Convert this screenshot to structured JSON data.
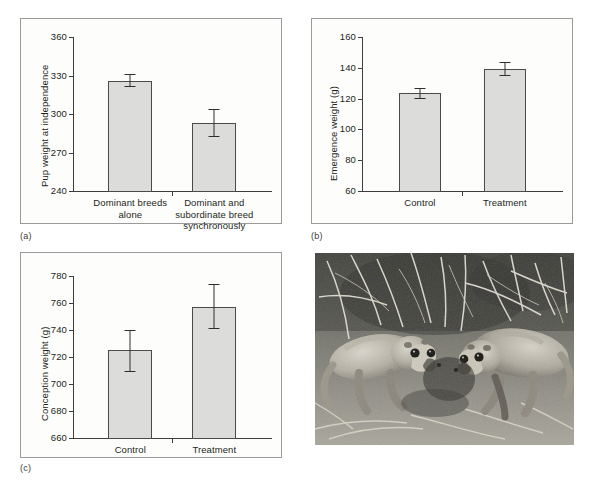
{
  "figure": {
    "panel_labels": {
      "a": "(a)",
      "b": "(b)",
      "c": "(c)"
    }
  },
  "chart_data": [
    {
      "panel": "(a)",
      "type": "bar",
      "title": "",
      "xlabel": "",
      "ylabel": "Pup weight at independence",
      "categories": [
        "Dominant breeds alone",
        "Dominant and subordinate breed synchronously"
      ],
      "category_lines": [
        [
          "Dominant breeds",
          "alone"
        ],
        [
          "Dominant and",
          "subordinate breed",
          "synchronously"
        ]
      ],
      "values": [
        326,
        293
      ],
      "errors_low": [
        321,
        282
      ],
      "errors_high": [
        331,
        304
      ],
      "ylim": [
        240,
        360
      ],
      "yticks": [
        240,
        270,
        300,
        330,
        360
      ],
      "grid": false,
      "legend": "none"
    },
    {
      "panel": "(b)",
      "type": "bar",
      "title": "",
      "xlabel": "",
      "ylabel": "Emergence weight (g)",
      "categories": [
        "Control",
        "Treatment"
      ],
      "category_lines": [
        [
          "Control"
        ],
        [
          "Treatment"
        ]
      ],
      "values": [
        123.5,
        139.5
      ],
      "errors_low": [
        120,
        134.5
      ],
      "errors_high": [
        127,
        144
      ],
      "ylim": [
        60,
        160
      ],
      "yticks": [
        60,
        80,
        100,
        120,
        140,
        160
      ],
      "grid": false,
      "legend": "none"
    },
    {
      "panel": "(c)",
      "type": "bar",
      "title": "",
      "xlabel": "",
      "ylabel": "Conception weight (g)",
      "categories": [
        "Control",
        "Treatment"
      ],
      "category_lines": [
        [
          "Control"
        ],
        [
          "Treatment"
        ]
      ],
      "values": [
        725,
        757
      ],
      "errors_low": [
        709,
        741
      ],
      "errors_high": [
        740,
        774
      ],
      "ylim": [
        660,
        780
      ],
      "yticks": [
        660,
        680,
        700,
        720,
        740,
        760,
        780
      ],
      "grid": false,
      "legend": "none"
    }
  ],
  "photo": {
    "caption": "",
    "alt": "two meerkats foraging on bare ground among dry twigs"
  },
  "colors": {
    "bar_fill": "#dcdcda",
    "bar_stroke": "#4a4a4a",
    "axis": "#3d3d3d",
    "text": "#231f20",
    "panel_border": "#9a9a9a",
    "panel_bg": "#fdfdfc"
  }
}
